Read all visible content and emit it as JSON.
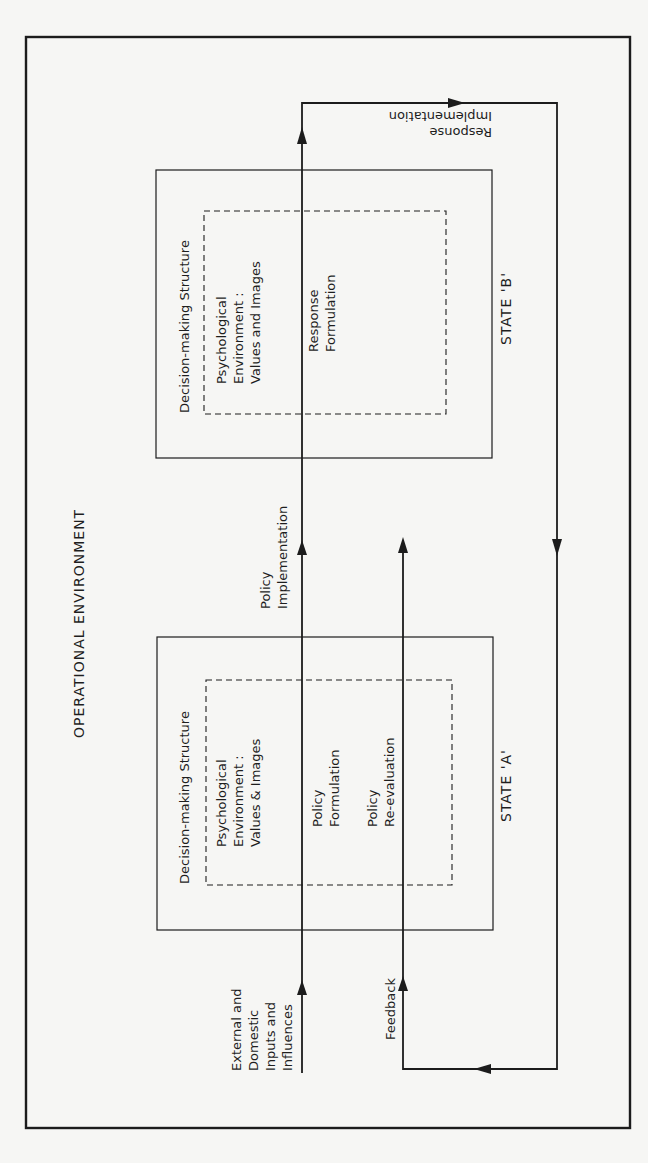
{
  "diagram": {
    "outer_label": "OPERATIONAL ENVIRONMENT",
    "state_b": {
      "title": "STATE 'B'",
      "structure_label": "Decision-making Structure",
      "psych_line1": "Psychological",
      "psych_line2": "Environment :",
      "psych_line3": "Values and Images",
      "process_line1": "Response",
      "process_line2": "Formulation"
    },
    "state_a": {
      "title": "STATE 'A'",
      "structure_label": "Decision-making Structure",
      "psych_line1": "Psychological",
      "psych_line2": "Environment :",
      "psych_line3": "Values & Images",
      "formulation_line1": "Policy",
      "formulation_line2": "Formulation",
      "reevaluation_line1": "Policy",
      "reevaluation_line2": "Re-evaluation"
    },
    "flows": {
      "inputs_line1": "External and",
      "inputs_line2": "Domestic",
      "inputs_line3": "Inputs and",
      "inputs_line4": "Influences",
      "policy_impl_line1": "Policy",
      "policy_impl_line2": "Implementation",
      "response_impl_line1": "Response",
      "response_impl_line2": "Implementation",
      "feedback": "Feedback"
    },
    "colors": {
      "ink": "#1c1c1c",
      "paper": "#f6f6f4"
    }
  }
}
